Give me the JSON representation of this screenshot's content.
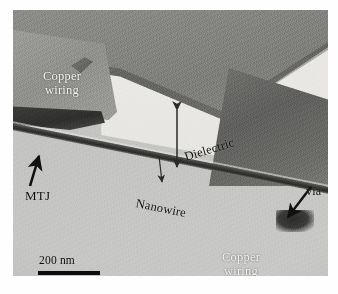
{
  "figure": {
    "type": "tem-micrograph",
    "scale_bar": {
      "label": "200 nm",
      "length_px": 62
    }
  },
  "annotations": {
    "copper_wiring_top": {
      "line1": "Copper",
      "line2": "wiring",
      "color": "#f4f2ee"
    },
    "copper_wiring_bottom": {
      "line1": "Copper",
      "line2": "wiring",
      "color": "#f4f2ee"
    },
    "mtj": {
      "label": "MTJ",
      "arrow": "arrow-up-right",
      "color": "#111110"
    },
    "via": {
      "label": "via",
      "arrow": "arrow-down-left",
      "color": "#111110"
    },
    "dielectric": {
      "label": "Dielectric",
      "arrow": "double-headed-vertical",
      "color": "#111110"
    },
    "nanowire": {
      "label": "Nanowire",
      "arrow": "arrow-down",
      "color": "#111110"
    }
  },
  "materials": {
    "top_layer_color": "#7c7c79",
    "dielectric_color": "#e9e7e3",
    "substrate_color": "#c6c6c4",
    "copper_color": "#8e8e8a",
    "nanowire_color": "#2f2f2d",
    "mtj_color": "#2e2e2c"
  }
}
